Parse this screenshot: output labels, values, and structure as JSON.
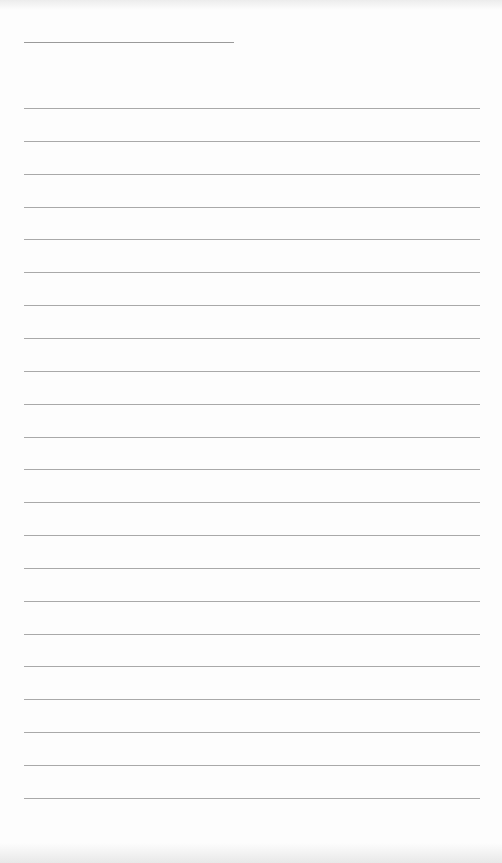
{
  "page": {
    "type": "lined-paper",
    "header_line": {
      "x": 24,
      "y": 42,
      "width": 210
    },
    "ruled_lines": {
      "count": 22,
      "first_y": 108,
      "spacing": 32.85,
      "x": 24,
      "width": 456
    },
    "colors": {
      "background": "#fdfdfd",
      "rule": "#a9a9a9"
    }
  }
}
